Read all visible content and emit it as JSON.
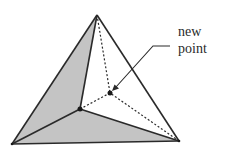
{
  "diagram": {
    "type": "triangulated tetrahedron (convex hull insertion)",
    "label": {
      "line1": "new",
      "line2": "point"
    },
    "colors": {
      "shaded_face": "#c4c4c4",
      "edge": "#2a2a2a",
      "background": "#ffffff"
    },
    "vertices": {
      "apex": [
        97,
        15
      ],
      "bottom_left": [
        12,
        144
      ],
      "bottom_right": [
        179,
        141
      ],
      "inner_existing": [
        80,
        109
      ],
      "new_point": [
        110,
        93
      ]
    },
    "leader_line": {
      "from": [
        170,
        46
      ],
      "elbow": [
        153,
        46
      ],
      "to": [
        115,
        88
      ]
    }
  }
}
